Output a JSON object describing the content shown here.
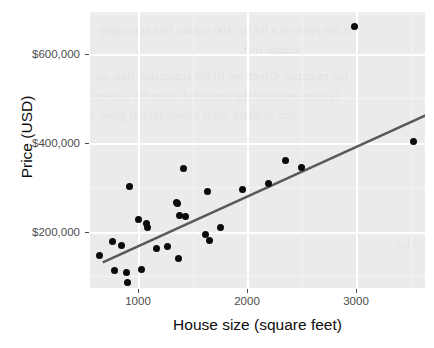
{
  "chart_data": {
    "type": "scatter",
    "title": "",
    "xlabel": "House size (square feet)",
    "ylabel": "Price (USD)",
    "xlim": [
      620,
      3500
    ],
    "ylim": [
      35000,
      715000
    ],
    "xticks": [
      1000,
      2000,
      3000
    ],
    "xtick_labels": [
      "1000",
      "2000",
      "3000"
    ],
    "yticks": [
      200000,
      400000,
      600000
    ],
    "ytick_labels": [
      "$200,000",
      "$400,000",
      "$600,000"
    ],
    "grid": true,
    "legend": null,
    "point_color": "#0a0a0a",
    "line_color": "#595959",
    "panel_color": "#ebebeb",
    "series": [
      {
        "name": "Houses",
        "points": [
          [
            700,
            115000
          ],
          [
            810,
            150000
          ],
          [
            830,
            78000
          ],
          [
            890,
            140000
          ],
          [
            930,
            73000
          ],
          [
            940,
            48000
          ],
          [
            960,
            285000
          ],
          [
            1040,
            205000
          ],
          [
            1060,
            80000
          ],
          [
            1105,
            195000
          ],
          [
            1115,
            185000
          ],
          [
            1190,
            133000
          ],
          [
            1290,
            138000
          ],
          [
            1360,
            245000
          ],
          [
            1375,
            243000
          ],
          [
            1385,
            108000
          ],
          [
            1390,
            213000
          ],
          [
            1425,
            330000
          ],
          [
            1440,
            212000
          ],
          [
            1610,
            167000
          ],
          [
            1630,
            272000
          ],
          [
            1645,
            152000
          ],
          [
            1740,
            185000
          ],
          [
            1930,
            278000
          ],
          [
            2155,
            292000
          ],
          [
            2300,
            348000
          ],
          [
            2440,
            332000
          ],
          [
            2890,
            680000
          ],
          [
            3400,
            395000
          ]
        ]
      }
    ],
    "fit_line": {
      "type": "linear-regression",
      "x_start": 730,
      "y_start": 98000,
      "x_end": 3640,
      "y_end": 478000
    }
  },
  "background_showthrough": {
    "visible": true,
    "description": "faint mirrored text bleeding through from the reverse side of the scanned page",
    "lines": [
      "is the price of a lot, so 100 square feet is roughly",
      "square feet.",
      "the example. Given we fit the regression line, an",
      "is often evaluate the predicted value for a given",
      "size is about 1000 square feet, it gives a"
    ],
    "side_text": "now"
  }
}
